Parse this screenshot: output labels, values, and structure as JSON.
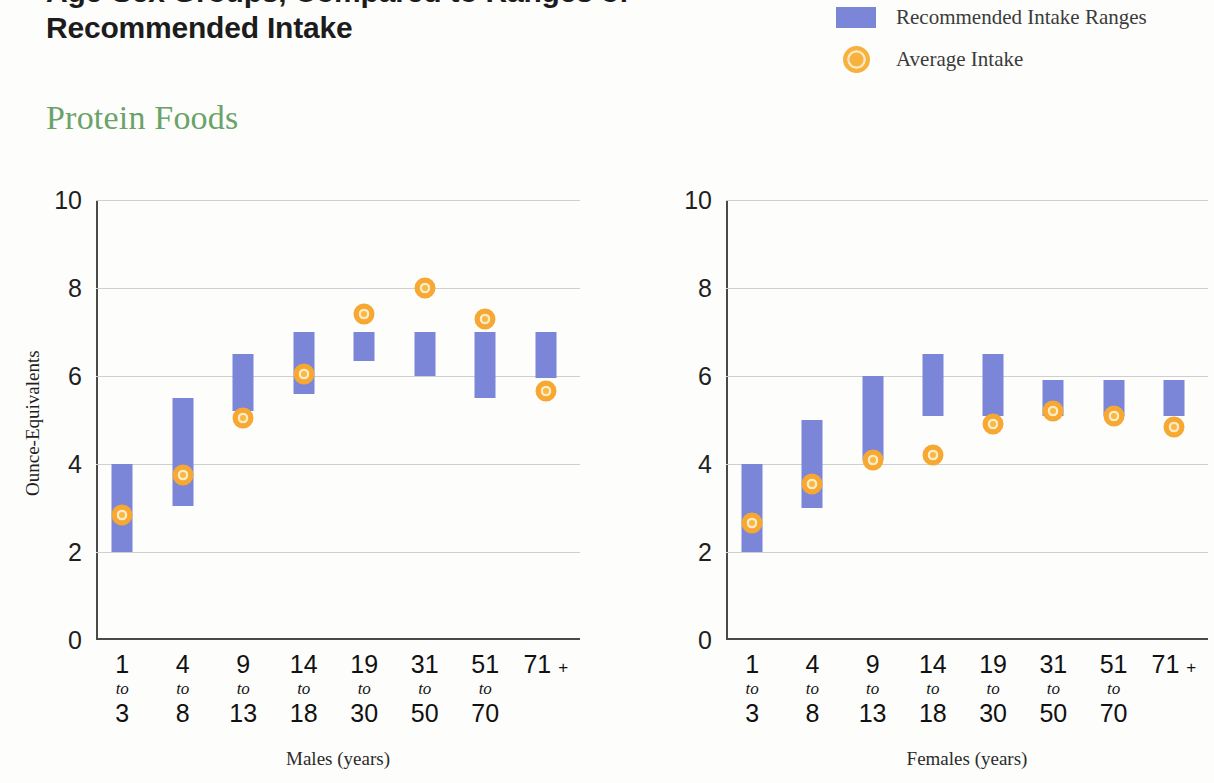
{
  "header": {
    "title_line1": "Age-Sex Groups, Compared to Ranges of",
    "title_line2": "Recommended Intake",
    "subtitle": "Protein Foods"
  },
  "legend": {
    "items": [
      {
        "label": "Recommended Intake Ranges",
        "marker": "blue-square-swatch",
        "color": "#7b86d8"
      },
      {
        "label": "Average Intake",
        "marker": "orange-circle-marker",
        "color": "#f6b23c"
      }
    ]
  },
  "chart_data": [
    {
      "type": "bar",
      "id": "males",
      "title": "Males (years)",
      "xlabel": "Males (years)",
      "ylabel": "Ounce-Equivalents",
      "ylim": [
        0,
        10
      ],
      "yticks": [
        0,
        2,
        4,
        6,
        8,
        10
      ],
      "ytick_labels": [
        "0",
        "2",
        "4",
        "6",
        "8",
        "10"
      ],
      "grid": true,
      "legend_position": "top-right",
      "categories": [
        "1 to 3",
        "4 to 8",
        "9 to 13",
        "14 to 18",
        "19 to 30",
        "31 to 50",
        "51 to 70",
        "71 +"
      ],
      "category_lines": [
        [
          "1",
          "to",
          "3"
        ],
        [
          "4",
          "to",
          "8"
        ],
        [
          "9",
          "to",
          "13"
        ],
        [
          "14",
          "to",
          "18"
        ],
        [
          "19",
          "to",
          "30"
        ],
        [
          "31",
          "to",
          "50"
        ],
        [
          "51",
          "to",
          "70"
        ],
        [
          "71 +",
          "",
          ""
        ]
      ],
      "series": [
        {
          "name": "Recommended Intake Ranges",
          "type": "range",
          "low": [
            2.0,
            3.05,
            5.2,
            5.6,
            6.35,
            6.0,
            5.5,
            5.95
          ],
          "high": [
            4.0,
            5.5,
            6.5,
            7.0,
            7.0,
            7.0,
            7.0,
            7.0
          ]
        },
        {
          "name": "Average Intake",
          "type": "point",
          "values": [
            2.85,
            3.75,
            5.05,
            6.05,
            7.4,
            8.0,
            7.3,
            5.65
          ]
        }
      ]
    },
    {
      "type": "bar",
      "id": "females",
      "title": "Females (years)",
      "xlabel": "Females (years)",
      "ylabel": "Ounce-Equivalents",
      "ylim": [
        0,
        10
      ],
      "yticks": [
        0,
        2,
        4,
        6,
        8,
        10
      ],
      "ytick_labels": [
        "0",
        "2",
        "4",
        "6",
        "8",
        "10"
      ],
      "grid": true,
      "legend_position": "top-right",
      "categories": [
        "1 to 3",
        "4 to 8",
        "9 to 13",
        "14 to 18",
        "19 to 30",
        "31 to 50",
        "51 to 70",
        "71 +"
      ],
      "category_lines": [
        [
          "1",
          "to",
          "3"
        ],
        [
          "4",
          "to",
          "8"
        ],
        [
          "9",
          "to",
          "13"
        ],
        [
          "14",
          "to",
          "18"
        ],
        [
          "19",
          "to",
          "30"
        ],
        [
          "31",
          "to",
          "50"
        ],
        [
          "51",
          "to",
          "70"
        ],
        [
          "71 +",
          "",
          ""
        ]
      ],
      "series": [
        {
          "name": "Recommended Intake Ranges",
          "type": "range",
          "low": [
            2.0,
            3.0,
            4.1,
            5.1,
            5.1,
            5.1,
            5.1,
            5.1
          ],
          "high": [
            4.0,
            5.0,
            6.0,
            6.5,
            6.5,
            5.9,
            5.9,
            5.9
          ]
        },
        {
          "name": "Average Intake",
          "type": "point",
          "values": [
            2.65,
            3.55,
            4.1,
            4.2,
            4.9,
            5.2,
            5.1,
            4.85
          ]
        }
      ]
    }
  ]
}
